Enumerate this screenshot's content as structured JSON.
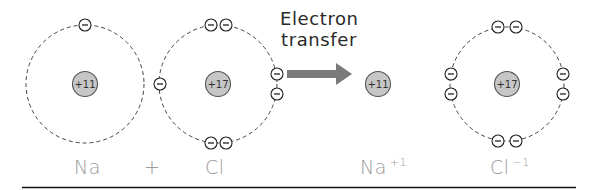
{
  "diagram": {
    "caption": [
      "Electron",
      "transfer"
    ],
    "colors": {
      "nucleus_fill": "#c6c6c6",
      "nucleus_stroke": "#555555",
      "shell_stroke": "#444444",
      "arrow": "#7a7a7a",
      "label_text": "#9a9a9a",
      "rule": "#111111"
    },
    "atoms": [
      {
        "id": "na",
        "label": "Na",
        "charge_label": "",
        "nucleus": "+11",
        "shell": true,
        "electrons": 1
      },
      {
        "id": "cl",
        "label": "Cl",
        "charge_label": "",
        "nucleus": "+17",
        "shell": true,
        "electrons": 7
      },
      {
        "id": "na-ion",
        "label": "Na",
        "charge_label": "+1",
        "nucleus": "+11",
        "shell": false,
        "electrons": 0
      },
      {
        "id": "cl-ion",
        "label": "Cl",
        "charge_label": "−1",
        "nucleus": "+17",
        "shell": true,
        "electrons": 8
      }
    ],
    "operator": "+",
    "electron_symbol": "−"
  }
}
